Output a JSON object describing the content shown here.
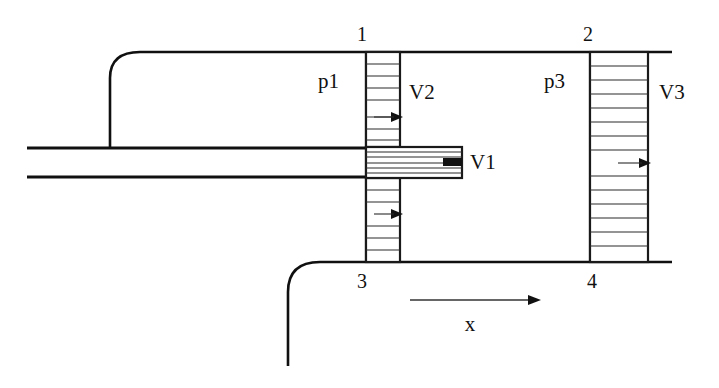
{
  "figure": {
    "background_color": "#ffffff",
    "line_color": "#101010"
  },
  "stations": [
    {
      "id": "station-1",
      "label": "1",
      "x": 362,
      "y": 34
    },
    {
      "id": "station-2",
      "label": "2",
      "x": 588,
      "y": 34
    },
    {
      "id": "station-3",
      "label": "3",
      "x": 362,
      "y": 288
    },
    {
      "id": "station-4",
      "label": "4",
      "x": 592,
      "y": 288
    }
  ],
  "labels": {
    "pressure_inlet": "p1",
    "pressure_mid": "p3",
    "velocity_primary": "V1",
    "velocity_secondary": "V2",
    "velocity_exit": "V3",
    "axis": "x"
  },
  "label_positions": {
    "p1": {
      "x": 318,
      "y": 88
    },
    "p3": {
      "x": 544,
      "y": 88
    },
    "V1": {
      "x": 470,
      "y": 168
    },
    "V2": {
      "x": 408,
      "y": 98
    },
    "V3": {
      "x": 660,
      "y": 98
    }
  },
  "profiles": [
    {
      "name": "secondary-upper-profile",
      "velocity_label": "V2",
      "x_left": 366,
      "x_right": 400,
      "y_top": 52,
      "y_bottom": 147,
      "hatch_lines": 7,
      "arrow_y": 117,
      "arrow_tip_x": 400
    },
    {
      "name": "primary-profile",
      "velocity_label": "V1",
      "x_left": 366,
      "x_right": 462,
      "y_top": 147,
      "y_bottom": 178,
      "hatch_lines": 7,
      "arrow_y": 163,
      "arrow_tip_x": 462
    },
    {
      "name": "secondary-lower-profile",
      "velocity_label": "V2",
      "x_left": 366,
      "x_right": 400,
      "y_top": 178,
      "y_bottom": 262,
      "hatch_lines": 6,
      "arrow_y": 214,
      "arrow_tip_x": 400
    },
    {
      "name": "exit-profile",
      "velocity_label": "V3",
      "x_left": 590,
      "x_right": 648,
      "y_top": 52,
      "y_bottom": 262,
      "hatch_lines": 14,
      "arrow_y": 163,
      "arrow_tip_x": 648
    }
  ],
  "axis": {
    "label": "x",
    "x_start": 410,
    "x_end": 537,
    "y": 300,
    "label_x": 470,
    "label_y": 330,
    "direction": "right"
  },
  "geometry": {
    "duct_top_y": 52,
    "duct_bottom_y": 262,
    "duct_right_x": 672,
    "nozzle_pipe_top_y": 148,
    "nozzle_pipe_bottom_y": 177,
    "nozzle_pipe_left_x": 27,
    "inlet_upper_corner_x": 110,
    "inlet_lower_corner_x": 288,
    "inlet_upper_vertical_bottom_y": 148,
    "inlet_lower_vertical_bottom_y": 366
  }
}
